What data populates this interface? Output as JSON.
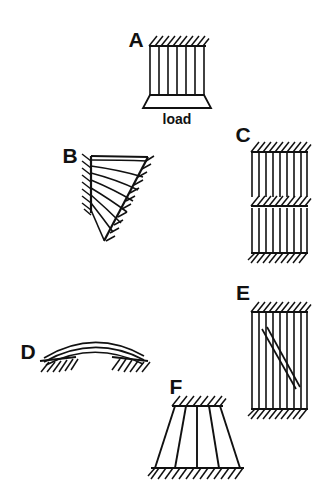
{
  "figure": {
    "background_color": "#ffffff",
    "ink_color": "#111111",
    "width": 326,
    "height": 497,
    "caption_labels": [
      "A",
      "B",
      "C",
      "D",
      "E",
      "F"
    ],
    "annotations": [
      {
        "name": "load",
        "text": "load"
      }
    ]
  },
  "panels": [
    {
      "id": "A",
      "label": "A",
      "label_x": 136,
      "label_y": 47,
      "description": "column of vertical fibers between hatched top support and trapezoidal load plate",
      "type": "column-with-load-plate",
      "fiber_count": 7,
      "box": {
        "x": 150,
        "y": 46,
        "width": 54,
        "height": 49
      },
      "hatch": {
        "x": 148,
        "y": 38,
        "width": 58,
        "side": "top",
        "slant": "up-right",
        "count": 10
      },
      "plate": {
        "top_left_x": 150,
        "top_right_x": 204,
        "top_y": 95,
        "bottom_left_x": 143,
        "bottom_right_x": 211,
        "bottom_y": 108
      },
      "load_label": {
        "text": "load",
        "x": 177,
        "y": 123
      }
    },
    {
      "id": "B",
      "label": "B",
      "label_x": 70,
      "label_y": 155,
      "description": "wedge fan of radiating curved fibers anchored on hatched left edge and hatched diagonal edge",
      "type": "fan-wedge",
      "apex": {
        "x": 91,
        "y": 156
      },
      "ray_count": 8,
      "top_edge": {
        "x1": 91,
        "y1": 156,
        "x2": 147,
        "y2": 156
      },
      "left_edge": {
        "x1": 91,
        "y1": 156,
        "x2": 91,
        "y2": 212
      },
      "tip": {
        "x": 104,
        "y": 241
      },
      "hatch_left": {
        "count": 8,
        "slant": "up-right"
      },
      "hatch_diagonal": {
        "count": 11,
        "slant": "up-left"
      }
    },
    {
      "id": "C",
      "label": "C",
      "label_x": 238,
      "label_y": 142,
      "description": "two stacked blocks of vertical fibers separated by hatched interface, hatched top and bottom",
      "type": "stacked-fiber-blocks",
      "fiber_count": 9,
      "block_top": {
        "x": 252,
        "y": 152,
        "width": 55,
        "height": 45
      },
      "block_bottom": {
        "x": 252,
        "y": 208,
        "width": 55,
        "height": 45
      },
      "hatch_top": {
        "y": 152,
        "count": 10,
        "slant": "up-right"
      },
      "hatch_middle": {
        "y": 206,
        "count": 10,
        "slant": "up-right"
      },
      "hatch_bottom": {
        "y": 253,
        "count": 10,
        "slant": "up-right"
      }
    },
    {
      "id": "D",
      "label": "D",
      "label_x": 22,
      "label_y": 352,
      "description": "shallow three-line arch springing from two hatched abutments",
      "type": "arch",
      "curve_count": 3,
      "left_support": {
        "x": 40,
        "y": 359,
        "width": 34
      },
      "right_support": {
        "x": 110,
        "y": 359,
        "width": 34
      },
      "rise": 22,
      "span": {
        "x1": 44,
        "x2": 144
      }
    },
    {
      "id": "E",
      "label": "E",
      "label_x": 238,
      "label_y": 300,
      "description": "block of vertical fibers with diagonal shear crack, hatched top and bottom",
      "type": "fiber-block-with-crack",
      "fiber_count": 9,
      "block": {
        "x": 252,
        "y": 312,
        "width": 55,
        "height": 97
      },
      "hatch_top": {
        "y": 312,
        "count": 10,
        "slant": "up-right"
      },
      "hatch_bottom": {
        "y": 409,
        "count": 10,
        "slant": "up-right"
      },
      "crack": {
        "x1": 263,
        "y1": 330,
        "x2": 297,
        "y2": 390,
        "lines": 2
      }
    },
    {
      "id": "F",
      "label": "F",
      "label_x": 172,
      "label_y": 393,
      "description": "splayed trapezoidal truss between narrow hatched top support and wide hatched base",
      "type": "splayed-truss",
      "member_count": 5,
      "top_support": {
        "x1": 173,
        "x2": 222,
        "y": 406
      },
      "base": {
        "x1": 152,
        "x2": 243,
        "y": 468
      },
      "hatch_top": {
        "count": 7,
        "slant": "up-right"
      },
      "hatch_bottom": {
        "count": 14,
        "slant": "up-right"
      }
    }
  ]
}
